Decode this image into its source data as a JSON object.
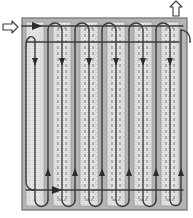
{
  "figure": {
    "kind": "technical-line-diagram",
    "canvas": {
      "width": 193,
      "height": 218
    }
  },
  "plate": {
    "name": "flow-field-plate",
    "x": 22,
    "y": 18,
    "width": 165,
    "height": 192,
    "fill": "#b4b4b4",
    "border_color": "#6e6e6e",
    "border_width": 1.2
  },
  "channels": {
    "count": 6,
    "band_fill": "#e3e3e3",
    "band_edge": "#9a9a9a",
    "dash_color": "#6f6f6f",
    "top": 22,
    "bottom": 206,
    "width": 18,
    "centers": [
      35,
      62,
      89,
      116,
      143,
      170
    ],
    "dashed_centerline": [
      false,
      true,
      true,
      true,
      true,
      true
    ],
    "speckle_color": "#bdbdbd"
  },
  "flow_path": {
    "name": "serpentine-flow-channel",
    "stroke": "#3a3a3a",
    "stroke_width": 1.4,
    "fill": "none",
    "legs": [
      48,
      75,
      102,
      129,
      156,
      181
    ],
    "turn_top_y": 26,
    "turn_bottom_y": 200,
    "inlet_y": 26,
    "outlet_y": 30
  },
  "arrow_markers": {
    "down_color": "#2b2b2b",
    "up_color": "#2b2b2b",
    "down_y": 58,
    "up_y": 168,
    "size": 6,
    "down_positions": [
      35,
      62,
      89,
      116,
      143,
      170
    ],
    "up_positions": [
      48,
      75,
      102,
      129,
      156,
      181
    ]
  },
  "inlet": {
    "label": "inlet-arrow",
    "direction": "right",
    "x": 3,
    "y": 21,
    "fill": "#ffffff",
    "stroke": "#3a3a3a"
  },
  "outlet": {
    "label": "outlet-arrow",
    "direction": "up",
    "x": 170,
    "y": 1,
    "fill": "#ffffff",
    "stroke": "#3a3a3a"
  },
  "inlet_feed": {
    "name": "inlet-feed-line",
    "from_x": 22,
    "to_x": 183,
    "y": 26
  },
  "outlet_header": {
    "name": "outlet-header-line",
    "from_x": 26,
    "to_x": 179,
    "y": 42
  },
  "bottom_header": {
    "name": "bottom-collector-line",
    "from_x": 26,
    "to_x": 183,
    "y": 190
  },
  "colors": {
    "background": "#ffffff",
    "plate": "#b4b4b4",
    "channel": "#e3e3e3",
    "line": "#3a3a3a"
  }
}
